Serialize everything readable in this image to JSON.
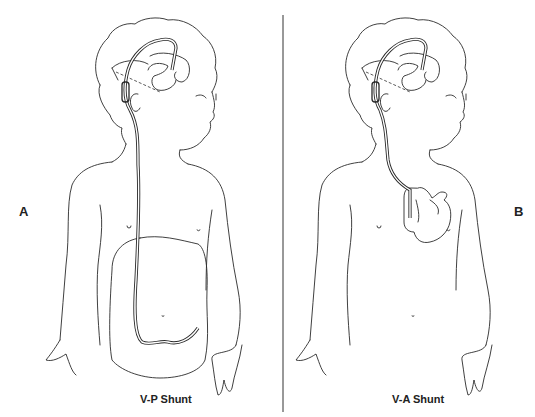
{
  "figure": {
    "panels": [
      {
        "letter": "A",
        "caption": "V-P Shunt",
        "description": "Ventriculoperitoneal shunt: catheter from brain ventricle tunneled under skin down to the peritoneal cavity"
      },
      {
        "letter": "B",
        "caption": "V-A Shunt",
        "description": "Ventriculoatrial shunt: catheter from brain ventricle routed through the neck into the right atrium of the heart"
      }
    ],
    "colors": {
      "line": "#2a2a2a",
      "background": "#ffffff",
      "divider": "#333333"
    }
  }
}
